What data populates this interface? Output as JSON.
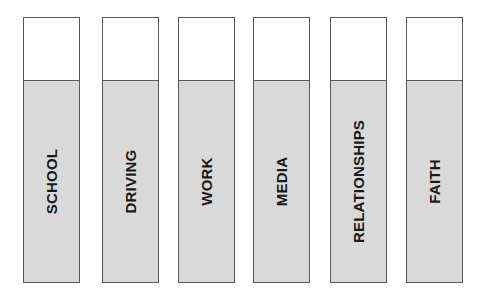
{
  "chart_data": {
    "type": "bar",
    "title": "",
    "subtitle": "",
    "xlabel": "",
    "ylabel": "",
    "orientation": "vertical",
    "grid": false,
    "legend": null,
    "axis_visible": false,
    "categories": [
      "SCHOOL",
      "DRIVING",
      "WORK",
      "MEDIA",
      "RELATIONSHIPS",
      "FAITH"
    ],
    "values": [
      76,
      76,
      76,
      76,
      76,
      76
    ],
    "ylim": [
      0,
      100
    ],
    "value_unit": "percent-of-bar-filled",
    "tick_labels": [],
    "annotations": [],
    "series": [
      {
        "name": "filled",
        "values": [
          76,
          76,
          76,
          76,
          76,
          76
        ]
      }
    ],
    "bars": [
      {
        "label": "SCHOOL",
        "fill_fraction": 0.76
      },
      {
        "label": "DRIVING",
        "fill_fraction": 0.76
      },
      {
        "label": "WORK",
        "fill_fraction": 0.76
      },
      {
        "label": "MEDIA",
        "fill_fraction": 0.76
      },
      {
        "label": "RELATIONSHIPS",
        "fill_fraction": 0.76
      },
      {
        "label": "FAITH",
        "fill_fraction": 0.76
      }
    ]
  },
  "style": {
    "background": "#ffffff",
    "bar_border": "#595959",
    "bar_fill": "#d9d9d9",
    "bar_empty": "#ffffff",
    "label_color": "#1a1a1a"
  }
}
